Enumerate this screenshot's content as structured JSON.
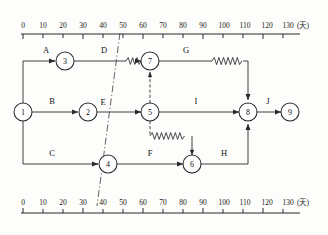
{
  "diagram": {
    "unit_label": "(天)",
    "axis": {
      "ticks": [
        0,
        10,
        20,
        30,
        40,
        50,
        60,
        70,
        80,
        90,
        100,
        110,
        120,
        130
      ],
      "tick_labels": [
        "0",
        "10",
        "20",
        "30",
        "40",
        "50",
        "60",
        "70",
        "80",
        "90",
        "100",
        "110",
        "120",
        "130"
      ],
      "min": 0,
      "max": 130,
      "px_origin": 23,
      "px_per_day": 2.0
    },
    "nodes": [
      {
        "id": "1",
        "label": "1",
        "day": 0,
        "x": 23,
        "y": 112,
        "r": 9
      },
      {
        "id": "2",
        "label": "2",
        "day": 32,
        "x": 88,
        "y": 112,
        "r": 9
      },
      {
        "id": "3",
        "label": "3",
        "day": 21,
        "x": 65,
        "y": 61,
        "r": 9
      },
      {
        "id": "4",
        "label": "4",
        "day": 42,
        "x": 108,
        "y": 164,
        "r": 9
      },
      {
        "id": "5",
        "label": "5",
        "day": 63,
        "x": 150,
        "y": 112,
        "r": 9
      },
      {
        "id": "6",
        "label": "6",
        "day": 84,
        "x": 192,
        "y": 164,
        "r": 9
      },
      {
        "id": "7",
        "label": "7",
        "day": 63,
        "x": 150,
        "y": 61,
        "r": 9
      },
      {
        "id": "8",
        "label": "8",
        "day": 112,
        "x": 248,
        "y": 112,
        "r": 9
      },
      {
        "id": "9",
        "label": "9",
        "day": 133,
        "x": 290,
        "y": 112,
        "r": 9
      }
    ],
    "activities": [
      {
        "name": "A",
        "from": "1",
        "to": "3",
        "label_x": 46,
        "label_y": 53
      },
      {
        "name": "B",
        "from": "1",
        "to": "2",
        "label_x": 52,
        "label_y": 104
      },
      {
        "name": "C",
        "from": "1",
        "to": "4",
        "label_x": 52,
        "label_y": 156
      },
      {
        "name": "D",
        "from": "3",
        "to": "7",
        "label_x": 104,
        "label_y": 53
      },
      {
        "name": "E",
        "from": "2",
        "to": "5",
        "label_x": 102,
        "label_y": 104
      },
      {
        "name": "F",
        "from": "4",
        "to": "6",
        "label_x": 150,
        "label_y": 156
      },
      {
        "name": "G",
        "from": "7",
        "to": "8",
        "label_x": 186,
        "label_y": 53
      },
      {
        "name": "H",
        "from": "6",
        "to": "8",
        "label_x": 224,
        "label_y": 156
      },
      {
        "name": "I",
        "from": "5",
        "to": "8",
        "label_x": 196,
        "label_y": 104
      },
      {
        "name": "J",
        "from": "8",
        "to": "9",
        "label_x": 268,
        "label_y": 104
      }
    ],
    "float_markers": [
      {
        "on": "D",
        "from_day": 53,
        "to_day": 63,
        "note": "zigzag free float before node 7"
      },
      {
        "on": "G",
        "from_day": 94,
        "to_day": 112,
        "note": "zigzag free float before node 8"
      },
      {
        "on": "dummy-5-6",
        "from_day": 63,
        "to_day": 84,
        "note": "zigzag free float on dummy to node 6"
      }
    ],
    "dummy_links": [
      {
        "from": "5",
        "to": "7",
        "style": "dashed-vertical"
      },
      {
        "from": "5",
        "to": "6",
        "style": "dashed-zigzag"
      }
    ],
    "cut_line": {
      "style": "dash-dot",
      "top_day": 47,
      "bottom_day": 37,
      "note": "diagonal dash-dot schedule cut line through node 4"
    }
  }
}
